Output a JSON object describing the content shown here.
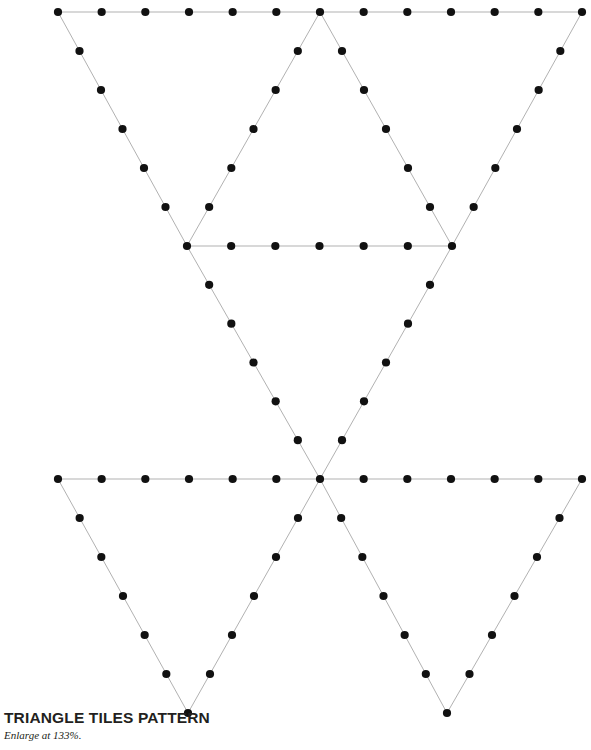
{
  "page": {
    "width": 591,
    "height": 750,
    "background_color": "#ffffff"
  },
  "caption": {
    "title": "TRIANGLE TILES PATTERN",
    "subtitle": "Enlarge at 133%.",
    "title_color": "#231f20",
    "subtitle_color": "#231f20"
  },
  "diagram": {
    "name": "triangle-tiles-pattern",
    "line_color": "#a8a8a8",
    "line_width": 0.9,
    "dot_color": "#111111",
    "dot_radius": 4.1,
    "divisions_per_edge": 6,
    "vertices": {
      "top_left": [
        58,
        12
      ],
      "top_mid": [
        320,
        12
      ],
      "top_right": [
        582,
        12
      ],
      "mid_left": [
        187,
        246
      ],
      "mid_right": [
        452,
        246
      ],
      "center_left": [
        58,
        479
      ],
      "center": [
        320,
        479
      ],
      "center_right": [
        582,
        479
      ],
      "bottom_left": [
        188,
        713
      ],
      "bottom_right": [
        447,
        713
      ]
    },
    "edges": [
      {
        "name": "top-horizontal-left",
        "from": "top_left",
        "to": "top_mid"
      },
      {
        "name": "top-horizontal-right",
        "from": "top_mid",
        "to": "top_right"
      },
      {
        "name": "upper-left-diagonal",
        "from": "top_left",
        "to": "mid_left"
      },
      {
        "name": "upper-right-diagonal",
        "from": "top_right",
        "to": "mid_right"
      },
      {
        "name": "inner-left-diagonal",
        "from": "top_mid",
        "to": "mid_left"
      },
      {
        "name": "inner-right-diagonal",
        "from": "top_mid",
        "to": "mid_right"
      },
      {
        "name": "mid-horizontal",
        "from": "mid_left",
        "to": "mid_right"
      },
      {
        "name": "mid-left-to-center",
        "from": "mid_left",
        "to": "center"
      },
      {
        "name": "mid-right-to-center",
        "from": "mid_right",
        "to": "center"
      },
      {
        "name": "low-horizontal-left",
        "from": "center_left",
        "to": "center"
      },
      {
        "name": "low-horizontal-right",
        "from": "center",
        "to": "center_right"
      },
      {
        "name": "lower-left-diagonal",
        "from": "center_left",
        "to": "bottom_left"
      },
      {
        "name": "lower-left-inner",
        "from": "center",
        "to": "bottom_left"
      },
      {
        "name": "lower-right-inner",
        "from": "center",
        "to": "bottom_right"
      },
      {
        "name": "lower-right-diagonal",
        "from": "center_right",
        "to": "bottom_right"
      }
    ]
  }
}
